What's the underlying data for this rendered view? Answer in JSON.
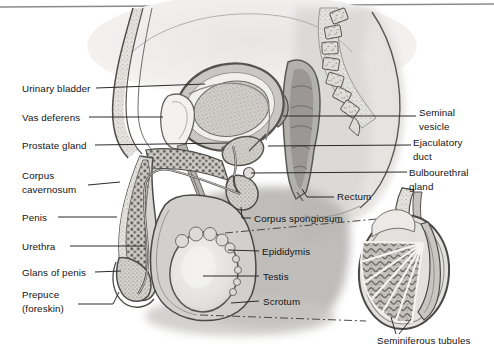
{
  "labels": {
    "left": [
      {
        "id": "urinary-bladder",
        "text": "Urinary bladder"
      },
      {
        "id": "vas-deferens",
        "text": "Vas deferens"
      },
      {
        "id": "prostate-gland",
        "text": "Prostate gland"
      },
      {
        "id": "corpus-cavernosum",
        "text": "Corpus\ncavernosum"
      },
      {
        "id": "penis",
        "text": "Penis"
      },
      {
        "id": "urethra",
        "text": "Urethra"
      },
      {
        "id": "glans-of-penis",
        "text": "Glans of penis"
      },
      {
        "id": "prepuce-foreskin",
        "text": "Prepuce\n(foreskin)"
      }
    ],
    "right": [
      {
        "id": "seminal-vesicle",
        "text": "Seminal\nvesicle"
      },
      {
        "id": "ejaculatory-duct",
        "text": "Ejaculatory\nduct"
      },
      {
        "id": "bulbourethral-gland",
        "text": "Bulbourethral\ngland"
      },
      {
        "id": "rectum",
        "text": "Rectum"
      },
      {
        "id": "corpus-spongiosum",
        "text": "Corpus spongiosum"
      },
      {
        "id": "epididymis",
        "text": "Epididymis"
      },
      {
        "id": "testis",
        "text": "Testis"
      },
      {
        "id": "scrotum",
        "text": "Scrotum"
      },
      {
        "id": "seminiferous-tubules",
        "text": "Seminiferous tubules"
      }
    ]
  },
  "colors": {
    "background": "#ffffff",
    "label_text": "#141414",
    "leader_line": "#2b2b2b",
    "outline": "#4a4846",
    "top_rule": "#8a8a8a",
    "wash_light": "#e6e5e3",
    "wash_mid": "#cecdca",
    "wash_dark": "#b6b4b1"
  }
}
